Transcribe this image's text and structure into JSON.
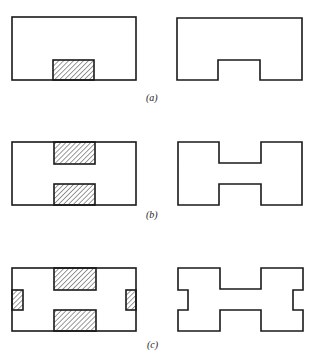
{
  "figure": {
    "panels": [
      {
        "id": "a",
        "label": "(a)",
        "hatched_regions": [
          "bottom-center"
        ],
        "resulting_shape": "rectangle with bottom center notch"
      },
      {
        "id": "b",
        "label": "(b)",
        "hatched_regions": [
          "top-center",
          "bottom-center"
        ],
        "resulting_shape": "H-shape"
      },
      {
        "id": "c",
        "label": "(c)",
        "hatched_regions": [
          "top-center",
          "bottom-center",
          "left-middle",
          "right-middle"
        ],
        "resulting_shape": "H-shape with side notches"
      }
    ],
    "colors": {
      "stroke": "#1a1a1a",
      "hatch": "#333333",
      "background": "#ffffff"
    }
  }
}
